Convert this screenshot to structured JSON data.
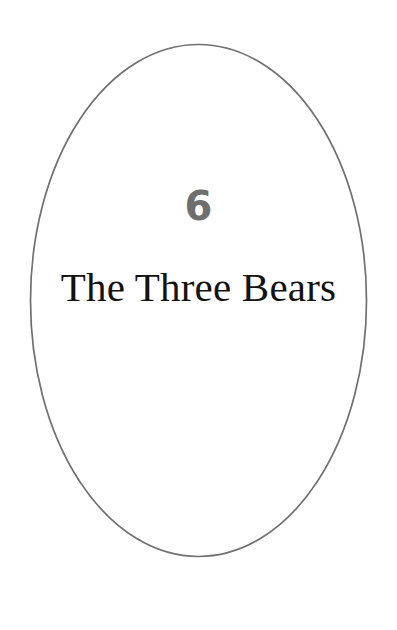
{
  "page": {
    "name": "chapter-title-page",
    "background_color": "#ffffff",
    "width": 397,
    "height": 630
  },
  "frame": {
    "shape": "ellipse",
    "stroke_color": "#707070",
    "stroke_width": 1.7,
    "fill": "none",
    "center_x": 198.5,
    "center_y": 300.5,
    "radius_x": 168,
    "radius_y": 256
  },
  "chapter": {
    "number": "6",
    "number_color": "#6e6e6e",
    "title": "The Three Bears",
    "title_color": "#14120f"
  }
}
